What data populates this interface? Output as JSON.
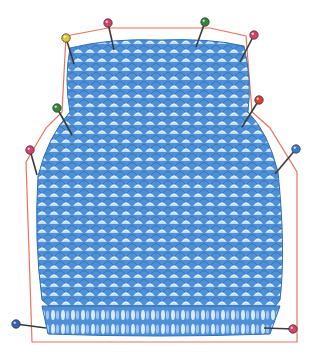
{
  "image": {
    "subject": "Knitted garment back piece pinned to a blocking template",
    "width": 319,
    "height": 360,
    "background": "#ffffff"
  },
  "colors": {
    "fabric_base": "#4f8fd6",
    "fabric_dark": "#2f6fb8",
    "fabric_light": "#bcd9f5",
    "fabric_highlight": "#eef6ff",
    "outline": "#e8735c",
    "pin_shaft": "#3a3a3a"
  },
  "template_outline": {
    "points": [
      [
        66,
        36
      ],
      [
        108,
        28
      ],
      [
        210,
        28
      ],
      [
        246,
        36
      ],
      [
        252,
        112
      ],
      [
        270,
        128
      ],
      [
        297,
        172
      ],
      [
        297,
        342
      ],
      [
        32,
        342
      ],
      [
        26,
        162
      ],
      [
        46,
        128
      ],
      [
        62,
        112
      ]
    ]
  },
  "pins": [
    {
      "name": "top-left-pin",
      "head": [
        66,
        38
      ],
      "tip": [
        74,
        64
      ],
      "color": "#e9c531"
    },
    {
      "name": "top-center-left-pin",
      "head": [
        108,
        23
      ],
      "tip": [
        114,
        50
      ],
      "color": "#d93f6b"
    },
    {
      "name": "top-center-right-pin",
      "head": [
        205,
        22
      ],
      "tip": [
        196,
        47
      ],
      "color": "#2d8a3a"
    },
    {
      "name": "top-right-pin",
      "head": [
        254,
        35
      ],
      "tip": [
        240,
        62
      ],
      "color": "#d93f6b"
    },
    {
      "name": "left-shoulder-pin",
      "head": [
        57,
        108
      ],
      "tip": [
        72,
        135
      ],
      "color": "#2d8a3a"
    },
    {
      "name": "right-shoulder-pin",
      "head": [
        259,
        100
      ],
      "tip": [
        242,
        127
      ],
      "color": "#e23a2e"
    },
    {
      "name": "left-armhole-pin",
      "head": [
        30,
        150
      ],
      "tip": [
        37,
        175
      ],
      "color": "#d93f6b"
    },
    {
      "name": "right-armhole-pin",
      "head": [
        296,
        149
      ],
      "tip": [
        275,
        174
      ],
      "color": "#3b7ad4"
    },
    {
      "name": "bottom-left-pin",
      "head": [
        16,
        324
      ],
      "tip": [
        46,
        328
      ],
      "color": "#2f62b8"
    },
    {
      "name": "bottom-right-pin",
      "head": [
        293,
        329
      ],
      "tip": [
        264,
        328
      ],
      "color": "#d93f6b"
    }
  ]
}
